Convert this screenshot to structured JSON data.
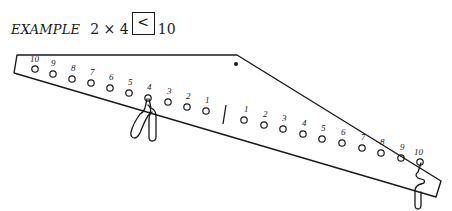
{
  "example": {
    "label": "EXAMPLE",
    "expression": "2 × 4",
    "answer_symbol": "<",
    "right_value": "10"
  },
  "balance": {
    "left_arm_labels": [
      "10",
      "9",
      "8",
      "7",
      "6",
      "5",
      "4",
      "3",
      "2",
      "1"
    ],
    "right_arm_labels": [
      "1",
      "2",
      "3",
      "4",
      "5",
      "6",
      "7",
      "8",
      "9",
      "10"
    ],
    "left_weight": {
      "peg": "4",
      "count": 2
    },
    "right_weight": {
      "peg": "10",
      "count": 1
    }
  }
}
